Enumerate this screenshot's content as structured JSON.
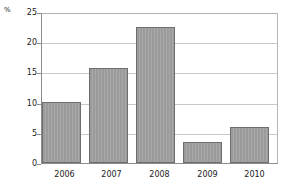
{
  "chart_data": {
    "type": "bar",
    "title": "",
    "subtitle": "",
    "xlabel": "",
    "ylabel": "%",
    "unit_label": "%",
    "categories": [
      "2006",
      "2007",
      "2008",
      "2009",
      "2010"
    ],
    "values": [
      10.1,
      15.9,
      22.7,
      3.5,
      6.0
    ],
    "ylim": [
      0,
      25
    ],
    "ytick_labels": [
      "0",
      "5",
      "10",
      "15",
      "20",
      "25"
    ],
    "ytick_values": [
      0,
      5,
      10,
      15,
      20,
      25
    ],
    "grid": "horizontal",
    "legend": "none",
    "annotations": [],
    "colors": {
      "bar_fill": "#9b9b9b",
      "bar_border": "#6e6e6e",
      "gridline": "#c9c9c9",
      "axis": "#8c8c8c",
      "background": "#ffffff",
      "text": "#1a1a1a"
    }
  }
}
